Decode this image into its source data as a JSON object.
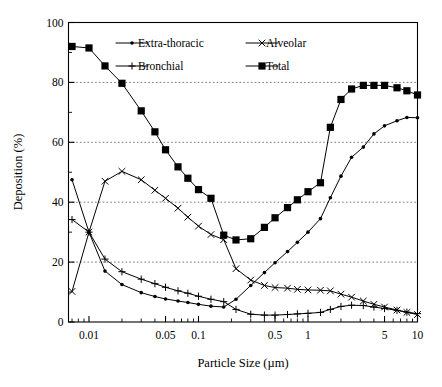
{
  "chart_data": {
    "type": "line",
    "title": "",
    "xlabel": "Particle Size (µm)",
    "ylabel": "Deposition (%)",
    "xscale": "log",
    "xlim": [
      0.0065,
      10
    ],
    "ylim": [
      0,
      100
    ],
    "grid": "horizontal dotted gridlines at 20, 40, 60, 80",
    "legend_position": "top-center inside axes",
    "x_tick_labels": [
      "0.01",
      "0.05",
      "0.1",
      "0.5",
      "1",
      "5",
      "10"
    ],
    "x_tick_values": [
      0.01,
      0.05,
      0.1,
      0.5,
      1,
      5,
      10
    ],
    "y_tick_labels": [
      "0",
      "20",
      "40",
      "60",
      "80",
      "100"
    ],
    "y_tick_values": [
      0,
      20,
      40,
      60,
      80,
      100
    ],
    "y_minor_ticks": [
      10,
      30,
      50,
      70,
      90
    ],
    "series": [
      {
        "name": "Extra-thoracic",
        "marker": "small-filled-circle",
        "x": [
          0.007,
          0.01,
          0.014,
          0.02,
          0.03,
          0.04,
          0.05,
          0.065,
          0.08,
          0.1,
          0.13,
          0.17,
          0.22,
          0.3,
          0.4,
          0.5,
          0.65,
          0.8,
          1.0,
          1.3,
          1.6,
          2.0,
          2.5,
          3.2,
          4.0,
          5.0,
          6.5,
          8.0,
          10.0
        ],
        "values": [
          47.5,
          30.0,
          17.0,
          12.5,
          9.8,
          8.5,
          7.7,
          7.0,
          6.5,
          5.9,
          5.3,
          5.0,
          7.6,
          12.2,
          16.5,
          19.8,
          23.5,
          26.6,
          30.0,
          34.5,
          41.5,
          48.7,
          55.0,
          58.4,
          62.8,
          65.5,
          67.2,
          68.3,
          68.2
        ]
      },
      {
        "name": "Alveolar",
        "marker": "x-cross",
        "x": [
          0.007,
          0.01,
          0.014,
          0.02,
          0.03,
          0.04,
          0.05,
          0.065,
          0.08,
          0.1,
          0.13,
          0.17,
          0.22,
          0.3,
          0.4,
          0.5,
          0.65,
          0.8,
          1.0,
          1.3,
          1.6,
          2.0,
          2.5,
          3.2,
          4.0,
          5.0,
          6.5,
          8.0,
          10.0
        ],
        "values": [
          10.2,
          30.0,
          47.0,
          50.3,
          47.5,
          44.0,
          41.3,
          38.0,
          35.0,
          32.0,
          29.2,
          27.5,
          17.8,
          14.0,
          12.2,
          11.5,
          11.3,
          10.9,
          10.7,
          10.6,
          10.4,
          9.3,
          8.3,
          7.0,
          5.9,
          5.0,
          4.0,
          3.2,
          2.5
        ]
      },
      {
        "name": "Bronchial",
        "marker": "plus",
        "x": [
          0.007,
          0.01,
          0.014,
          0.02,
          0.03,
          0.04,
          0.05,
          0.065,
          0.08,
          0.1,
          0.13,
          0.17,
          0.22,
          0.3,
          0.4,
          0.5,
          0.65,
          0.8,
          1.0,
          1.3,
          1.6,
          2.0,
          2.5,
          3.2,
          4.0,
          5.0,
          6.5,
          8.0,
          10.0
        ],
        "values": [
          34.2,
          30.0,
          21.0,
          16.8,
          14.3,
          12.8,
          11.6,
          10.4,
          9.6,
          8.6,
          7.6,
          6.8,
          4.2,
          2.6,
          2.3,
          2.3,
          2.5,
          2.7,
          2.9,
          3.2,
          4.2,
          5.2,
          5.6,
          5.5,
          5.0,
          4.5,
          3.9,
          3.3,
          2.8
        ]
      },
      {
        "name": "Total",
        "marker": "large-filled-square",
        "x": [
          0.007,
          0.01,
          0.014,
          0.02,
          0.03,
          0.04,
          0.05,
          0.065,
          0.08,
          0.1,
          0.13,
          0.17,
          0.22,
          0.3,
          0.4,
          0.5,
          0.65,
          0.8,
          1.0,
          1.3,
          1.6,
          2.0,
          2.5,
          3.2,
          4.0,
          5.0,
          6.5,
          8.0,
          10.0
        ],
        "values": [
          92.0,
          91.5,
          85.5,
          79.7,
          70.5,
          63.5,
          57.5,
          51.8,
          48.0,
          44.2,
          41.3,
          29.0,
          27.4,
          27.8,
          31.6,
          34.8,
          38.2,
          40.8,
          43.5,
          46.5,
          65.0,
          74.3,
          77.8,
          79.0,
          79.0,
          79.0,
          78.2,
          77.2,
          75.8
        ]
      }
    ]
  },
  "legend": {
    "entries": [
      {
        "label": "Extra-thoracic",
        "marker": "small-filled-circle"
      },
      {
        "label": "Alveolar",
        "marker": "x-cross"
      },
      {
        "label": "Bronchial",
        "marker": "plus"
      },
      {
        "label": "Total",
        "marker": "large-filled-square"
      }
    ]
  },
  "colors": {
    "ink": "#000000",
    "background": "#ffffff",
    "gridline": "#555555"
  }
}
